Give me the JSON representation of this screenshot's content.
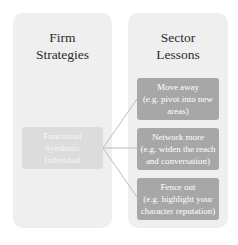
{
  "diagram": {
    "left_panel": {
      "title_lines": [
        "Firm",
        "Strategies"
      ],
      "box_lines": [
        "Functional",
        "Symbolic",
        "Individual"
      ]
    },
    "right_panel": {
      "title_lines": [
        "Sector",
        "Lessons"
      ],
      "boxes": [
        {
          "title": "Move away",
          "detail_lines": [
            "(e.g. pivot into new",
            "areas)"
          ]
        },
        {
          "title": "Network more",
          "detail_lines": [
            "(e.g. widen the reach",
            "and conversation)"
          ]
        },
        {
          "title": "Fence out",
          "detail_lines": [
            "(e.g. highlight your",
            "character reputation)"
          ]
        }
      ]
    },
    "colors": {
      "panel_bg": "#efefef",
      "left_box_bg": "#dcdcdc",
      "right_box_bg": "#a7a7a7",
      "connector": "#bdbdbd",
      "title_text": "#2b2b2b"
    }
  }
}
